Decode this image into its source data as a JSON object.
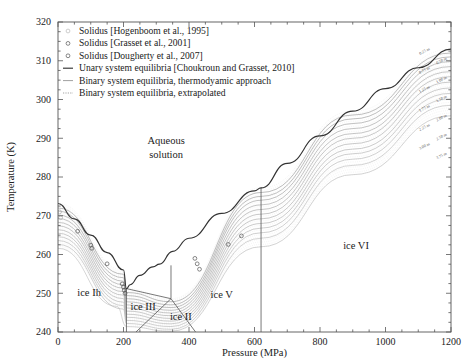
{
  "figure": {
    "kind": "phase-diagram",
    "background": "#ffffff",
    "frame_color": "#555555"
  },
  "axes": {
    "x": {
      "label": "Pressure (MPa)",
      "min": 0,
      "max": 1200,
      "ticks": [
        0,
        200,
        400,
        600,
        800,
        1000,
        1200
      ],
      "tick_labels": [
        "0",
        "200",
        "400",
        "600",
        "800",
        "1000",
        "1200"
      ],
      "minor_step": 50
    },
    "y": {
      "label": "Temperature (K)",
      "min": 240,
      "max": 320,
      "ticks": [
        240,
        250,
        260,
        270,
        280,
        290,
        300,
        310,
        320
      ],
      "tick_labels": [
        "240",
        "250",
        "260",
        "270",
        "280",
        "290",
        "300",
        "310",
        "320"
      ],
      "minor_step": 2.5
    },
    "grid": false
  },
  "legend": {
    "position": "top-left",
    "items": [
      {
        "marker": "circle-open-faint",
        "label": "Solidus [Hogenboom et al., 1995]",
        "color": "#b9b9b9"
      },
      {
        "marker": "circle-open",
        "label": "Solidus [Grasset et al., 2001]",
        "color": "#555555"
      },
      {
        "marker": "circle-open",
        "label": "Solidus [Dougherty et al., 2007]",
        "color": "#555555"
      },
      {
        "marker": "line-solid",
        "label": "Unary system equilibria [Choukroun and Grasset, 2010]",
        "color": "#333333"
      },
      {
        "marker": "line-solid-thin",
        "label": "Binary system equilibria, thermodyamic approach",
        "color": "#777777"
      },
      {
        "marker": "line-dotted",
        "label": "Binary system equilibria, extrapolated",
        "color": "#999999"
      }
    ]
  },
  "phase_labels": [
    {
      "text": "Aqueous",
      "p": 330,
      "t": 288.5
    },
    {
      "text": "solution",
      "p": 330,
      "t": 285.0
    },
    {
      "text": "ice Ih",
      "p": 95,
      "t": 249.2
    },
    {
      "text": "ice III",
      "p": 260,
      "t": 245.8
    },
    {
      "text": "ice II",
      "p": 375,
      "t": 243.2
    },
    {
      "text": "ice V",
      "p": 500,
      "t": 248.8
    },
    {
      "text": "ice VI",
      "p": 910,
      "t": 261.5
    }
  ],
  "isopleth_labels": [
    "0.25 m",
    "0.50 m",
    "0.75 m",
    "1.00 m",
    "1.25 m",
    "1.50 m",
    "1.75 m",
    "2.00 m",
    "2.25 m",
    "2.50 m",
    "3.00 m",
    "3.75 m"
  ],
  "chart_data": {
    "type": "line",
    "title": "",
    "xlabel": "Pressure (MPa)",
    "ylabel": "Temperature (K)",
    "xlim": [
      0,
      1200
    ],
    "ylim": [
      240,
      320
    ],
    "grid": false,
    "legend_position": "top-left",
    "series": [
      {
        "name": "Unary system equilibria [Choukroun and Grasset, 2010]",
        "style": "solid",
        "color": "#333333",
        "comment": "pure-water melting curve: ice Ih, III, V, VI liquidus branches",
        "x": [
          0,
          50,
          100,
          150,
          200,
          209,
          220,
          250,
          290,
          310,
          350,
          400,
          500,
          600,
          620,
          700,
          800,
          900,
          1000,
          1100,
          1200
        ],
        "y": [
          273.15,
          269.2,
          265.0,
          260.5,
          256.0,
          251.2,
          252.2,
          254.6,
          256.8,
          257.5,
          260.8,
          264.2,
          270.6,
          276.4,
          277.2,
          283.5,
          290.6,
          297.0,
          302.8,
          308.2,
          313.0
        ]
      },
      {
        "name": "Unary ice III / ice II / ice V internal boundaries",
        "style": "solid-thin",
        "color": "#555555",
        "comment": "solid-solid boundary segments below the liquidus",
        "segments": [
          {
            "x": [
              209,
              209
            ],
            "y": [
              251.2,
              240.0
            ]
          },
          {
            "x": [
              209,
              345
            ],
            "y": [
              251.2,
              248.6
            ]
          },
          {
            "x": [
              345,
              345
            ],
            "y": [
              248.6,
              257.2
            ]
          },
          {
            "x": [
              345,
              420
            ],
            "y": [
              248.6,
              240.0
            ]
          },
          {
            "x": [
              345,
              238
            ],
            "y": [
              248.6,
              240.0
            ]
          },
          {
            "x": [
              620,
              620
            ],
            "y": [
              277.2,
              240.0
            ]
          }
        ]
      },
      {
        "name": "0.25 m",
        "style": "solid-thin",
        "color": "#888888",
        "molality": 0.25,
        "x": [
          0,
          200,
          209,
          345,
          620,
          900,
          1200
        ],
        "y": [
          272.0,
          254.9,
          250.2,
          247.8,
          276.0,
          296.0,
          312.0
        ]
      },
      {
        "name": "0.50 m",
        "style": "solid-thin",
        "color": "#8c8c8c",
        "molality": 0.5,
        "x": [
          0,
          200,
          209,
          345,
          620,
          900,
          1200
        ],
        "y": [
          271.2,
          254.0,
          249.4,
          247.0,
          275.0,
          295.0,
          311.0
        ]
      },
      {
        "name": "0.75 m",
        "style": "solid-thin",
        "color": "#909090",
        "molality": 0.75,
        "x": [
          0,
          200,
          209,
          345,
          620,
          900,
          1200
        ],
        "y": [
          270.2,
          253.1,
          248.6,
          246.3,
          274.0,
          293.8,
          309.8
        ]
      },
      {
        "name": "1.00 m",
        "style": "solid-thin",
        "color": "#949494",
        "molality": 1.0,
        "x": [
          0,
          200,
          209,
          345,
          620,
          900,
          1200
        ],
        "y": [
          269.3,
          252.2,
          247.8,
          245.6,
          272.8,
          292.5,
          308.5
        ]
      },
      {
        "name": "1.25 m",
        "style": "solid-thin",
        "color": "#989898",
        "molality": 1.25,
        "x": [
          0,
          200,
          209,
          345,
          620,
          900,
          1200
        ],
        "y": [
          268.3,
          251.3,
          247.0,
          244.9,
          271.6,
          291.2,
          307.2
        ]
      },
      {
        "name": "1.50 m",
        "style": "solid-thin",
        "color": "#9c9c9c",
        "molality": 1.5,
        "x": [
          0,
          200,
          209,
          345,
          620,
          900,
          1200
        ],
        "y": [
          267.4,
          250.4,
          246.2,
          244.2,
          270.4,
          290.0,
          305.9
        ]
      },
      {
        "name": "1.75 m",
        "style": "solid-thin",
        "color": "#a0a0a0",
        "molality": 1.75,
        "x": [
          0,
          200,
          209,
          345,
          620,
          900,
          1200
        ],
        "y": [
          266.4,
          249.5,
          245.4,
          243.5,
          269.2,
          288.6,
          304.5
        ]
      },
      {
        "name": "2.00 m",
        "style": "solid-thin",
        "color": "#a4a4a4",
        "molality": 2.0,
        "x": [
          0,
          200,
          209,
          345,
          620,
          900,
          1200
        ],
        "y": [
          265.5,
          248.6,
          244.6,
          242.8,
          268.0,
          287.2,
          303.0
        ]
      },
      {
        "name": "2.25 m",
        "style": "solid-thin",
        "color": "#a8a8a8",
        "molality": 2.25,
        "x": [
          0,
          200,
          209,
          345,
          620,
          900,
          1200
        ],
        "y": [
          264.6,
          247.7,
          243.8,
          242.1,
          266.8,
          286.0,
          301.6
        ]
      },
      {
        "name": "2.50 m",
        "style": "solid-thin",
        "color": "#acacac",
        "molality": 2.5,
        "x": [
          0,
          200,
          209,
          345,
          620,
          900,
          1200
        ],
        "y": [
          263.6,
          246.8,
          243.0,
          241.4,
          265.6,
          284.6,
          300.2
        ]
      },
      {
        "name": "3.00 m",
        "style": "solid-thin",
        "color": "#b0b0b0",
        "molality": 3.0,
        "x": [
          0,
          200,
          209,
          345,
          620,
          900,
          1200
        ],
        "y": [
          262.6,
          245.9,
          242.2,
          240.7,
          264.2,
          283.0,
          298.5
        ]
      },
      {
        "name": "3.75 m",
        "style": "solid-thin",
        "color": "#b4b4b4",
        "molality": 3.75,
        "x": [
          0,
          180,
          209,
          345,
          620,
          900,
          1200
        ],
        "y": [
          261.6,
          246.6,
          241.4,
          240.2,
          262.0,
          280.6,
          295.8
        ]
      }
    ],
    "scatter": [
      {
        "name": "Solidus [Hogenboom et al., 1995]",
        "marker": "circle-open",
        "color": "#aaaaaa",
        "points": [
          [
            5,
            271.0
          ],
          [
            8,
            269.5
          ]
        ]
      },
      {
        "name": "Solidus [Grasset et al., 2001]",
        "marker": "circle-open",
        "color": "#555555",
        "points": [
          [
            60,
            266.0
          ],
          [
            100,
            262.4
          ],
          [
            103,
            261.6
          ],
          [
            150,
            257.6
          ],
          [
            196,
            252.4
          ],
          [
            200,
            251.6
          ],
          [
            202,
            250.8
          ],
          [
            205,
            250.0
          ]
        ]
      },
      {
        "name": "Solidus [Dougherty et al., 2007]",
        "marker": "circle-open",
        "color": "#555555",
        "points": [
          [
            418,
            259.0
          ],
          [
            425,
            257.6
          ],
          [
            432,
            256.2
          ],
          [
            520,
            262.6
          ],
          [
            560,
            264.8
          ]
        ]
      }
    ]
  }
}
